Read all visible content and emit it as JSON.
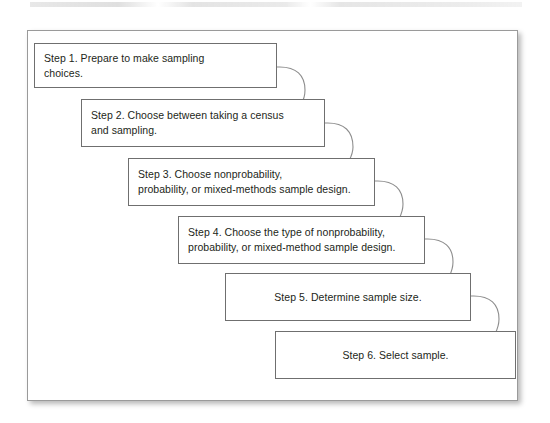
{
  "figure": {
    "type": "flow-staircase-diagram",
    "title": "",
    "frame": {
      "border_color": "#9a9a9a",
      "background": "#ffffff"
    },
    "box_style": {
      "border_color": "#6f6f6f",
      "background": "#ffffff",
      "text_color": "#231f20"
    },
    "connector_style": {
      "shape": "arc",
      "color": "#8d8d8d"
    }
  },
  "steps": [
    {
      "id": "step-1",
      "label": "Step 1. Prepare to make sampling\nchoices.",
      "number": 1,
      "align": "left"
    },
    {
      "id": "step-2",
      "label": "Step 2. Choose between taking a census\nand sampling.",
      "number": 2,
      "align": "left"
    },
    {
      "id": "step-3",
      "label": "Step 3. Choose nonprobability,\nprobability, or mixed-methods sample design.",
      "number": 3,
      "align": "left"
    },
    {
      "id": "step-4",
      "label": "Step 4. Choose the type of nonprobability,\nprobability, or mixed-method sample design.",
      "number": 4,
      "align": "left"
    },
    {
      "id": "step-5",
      "label": "Step 5. Determine sample size.",
      "number": 5,
      "align": "center"
    },
    {
      "id": "step-6",
      "label": "Step 6. Select sample.",
      "number": 6,
      "align": "center"
    }
  ]
}
